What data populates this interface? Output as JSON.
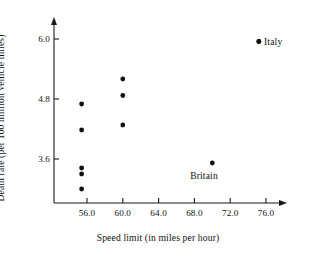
{
  "chart_data": {
    "type": "scatter",
    "title": "",
    "xlabel": "Speed limit (in miles per hour)",
    "ylabel": "Death rate (per 100 million vehicle miles)",
    "xlim": [
      53.2,
      78.0
    ],
    "ylim": [
      2.4,
      6.4
    ],
    "xticks": [
      56.0,
      60.0,
      64.0,
      68.0,
      72.0,
      76.0
    ],
    "yticks": [
      3.6,
      4.8,
      6.0
    ],
    "xtick_labels": [
      "56.0",
      "60.0",
      "64.0",
      "68.0",
      "72.0",
      "76.0"
    ],
    "ytick_labels": [
      "3.6",
      "4.8",
      "6.0"
    ],
    "grid": false,
    "legend": "none",
    "points": [
      {
        "x": 55.4,
        "y": 4.7,
        "label": ""
      },
      {
        "x": 55.4,
        "y": 4.18,
        "label": ""
      },
      {
        "x": 55.4,
        "y": 3.42,
        "label": ""
      },
      {
        "x": 55.4,
        "y": 3.3,
        "label": ""
      },
      {
        "x": 55.4,
        "y": 3.0,
        "label": ""
      },
      {
        "x": 60.0,
        "y": 5.2,
        "label": ""
      },
      {
        "x": 60.0,
        "y": 4.87,
        "label": ""
      },
      {
        "x": 60.0,
        "y": 4.28,
        "label": ""
      },
      {
        "x": 70.0,
        "y": 3.52,
        "label": "Britain"
      },
      {
        "x": 75.2,
        "y": 5.95,
        "label": "Italy"
      }
    ],
    "annotations": [
      {
        "text": "Italy",
        "for_point_x": 75.2,
        "for_point_y": 5.95,
        "position": "right"
      },
      {
        "text": "Britain",
        "for_point_x": 70.0,
        "for_point_y": 3.52,
        "position": "below"
      }
    ]
  },
  "style": {
    "point_color": "#111111",
    "axis_color": "#1a1a1a",
    "background": "#ffffff"
  }
}
